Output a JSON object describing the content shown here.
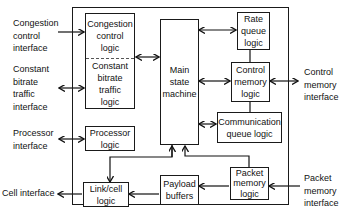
{
  "diagram": {
    "external_interfaces": {
      "congestion_control": [
        "Congestion",
        "control",
        "interface"
      ],
      "constant_bitrate": [
        "Constant",
        "bitrate",
        "traffic",
        "interface"
      ],
      "processor": [
        "Processor",
        "interface"
      ],
      "cell": [
        "Cell interface"
      ],
      "control_memory": [
        "Control",
        "memory",
        "interface"
      ],
      "packet_memory": [
        "Packet",
        "memory",
        "interface"
      ]
    },
    "blocks": {
      "congestion_control_logic": [
        "Congestion",
        "control",
        "logic"
      ],
      "constant_bitrate_logic": [
        "Constant",
        "bitrate",
        "traffic",
        "logic"
      ],
      "main_state_machine": [
        "Main",
        "state",
        "machine"
      ],
      "rate_queue_logic": [
        "Rate",
        "queue",
        "logic"
      ],
      "control_memory_logic": [
        "Control",
        "memory",
        "logic"
      ],
      "communication_queue_logic": [
        "Communication",
        "queue logic"
      ],
      "processor_logic": [
        "Processor",
        "logic"
      ],
      "link_cell_logic": [
        "Link/cell",
        "logic"
      ],
      "payload_buffers": [
        "Payload",
        "buffers"
      ],
      "packet_memory_logic": [
        "Packet",
        "memory",
        "logic"
      ]
    },
    "connections": [
      {
        "from": "Congestion control interface",
        "to": "Congestion control logic",
        "type": "one-way"
      },
      {
        "from": "Constant bitrate traffic interface",
        "to": "Constant bitrate traffic logic",
        "type": "bidirectional"
      },
      {
        "from": "Congestion/Constant bitrate logic",
        "to": "Main state machine",
        "type": "bidirectional"
      },
      {
        "from": "Main state machine",
        "to": "Rate queue logic",
        "type": "bidirectional"
      },
      {
        "from": "Main state machine",
        "to": "Control memory logic",
        "type": "bidirectional"
      },
      {
        "from": "Rate queue logic",
        "to": "Control memory logic",
        "type": "line"
      },
      {
        "from": "Control memory logic",
        "to": "Control memory interface",
        "type": "bidirectional"
      },
      {
        "from": "Control memory logic",
        "to": "Communication queue logic",
        "type": "line"
      },
      {
        "from": "Main state machine",
        "to": "Communication queue logic",
        "type": "bidirectional"
      },
      {
        "from": "Processor interface",
        "to": "Processor logic",
        "type": "bidirectional"
      },
      {
        "from": "Main state machine",
        "to": "Link/cell logic",
        "type": "one-way"
      },
      {
        "from": "Packet memory logic",
        "to": "Main state machine",
        "type": "one-way"
      },
      {
        "from": "Packet memory interface",
        "to": "Packet memory logic",
        "type": "one-way"
      },
      {
        "from": "Packet memory logic",
        "to": "Payload buffers",
        "type": "one-way"
      },
      {
        "from": "Payload buffers",
        "to": "Link/cell logic",
        "type": "one-way"
      },
      {
        "from": "Link/cell logic",
        "to": "Cell interface",
        "type": "one-way"
      }
    ]
  }
}
